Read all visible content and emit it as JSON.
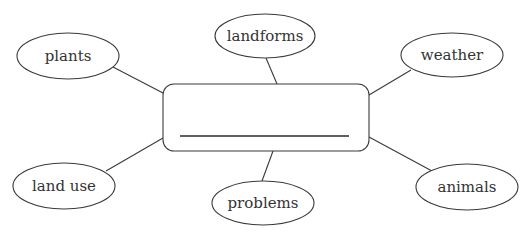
{
  "diagram": {
    "type": "concept-web",
    "colors": {
      "stroke": "#3a3a3a",
      "text": "#333333",
      "background": "#ffffff"
    },
    "center": {
      "label": "",
      "answer_blank": true
    },
    "nodes": [
      {
        "id": "plants",
        "label": "plants"
      },
      {
        "id": "landforms",
        "label": "landforms"
      },
      {
        "id": "weather",
        "label": "weather"
      },
      {
        "id": "land-use",
        "label": "land use"
      },
      {
        "id": "problems",
        "label": "problems"
      },
      {
        "id": "animals",
        "label": "animals"
      }
    ]
  }
}
